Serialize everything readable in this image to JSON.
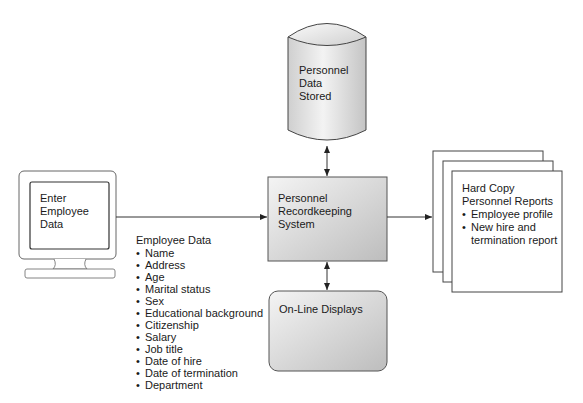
{
  "diagram": {
    "type": "system-flow",
    "terminal": {
      "label": "Enter\nEmployee\nData"
    },
    "database": {
      "label": "Personnel\nData\nStored"
    },
    "system": {
      "label": "Personnel\nRecordkeeping\nSystem"
    },
    "displays": {
      "label": "On-Line Displays"
    },
    "reports": {
      "title": "Hard Copy\nPersonnel Reports",
      "items": [
        "Employee profile",
        "New hire and\ntermination report"
      ]
    },
    "employee_data": {
      "title": "Employee Data",
      "items": [
        "Name",
        "Address",
        "Age",
        "Marital status",
        "Sex",
        "Educational background",
        "Citizenship",
        "Salary",
        "Job title",
        "Date of hire",
        "Date of termination",
        "Department"
      ]
    },
    "connections": [
      {
        "from": "terminal",
        "to": "system",
        "direction": "one-way"
      },
      {
        "from": "system",
        "to": "database",
        "direction": "two-way"
      },
      {
        "from": "system",
        "to": "displays",
        "direction": "two-way"
      },
      {
        "from": "system",
        "to": "reports",
        "direction": "one-way"
      }
    ],
    "colors": {
      "stroke": "#333333",
      "fill_light": "#f2f2f2",
      "fill_dark": "#c8c8c8"
    }
  }
}
